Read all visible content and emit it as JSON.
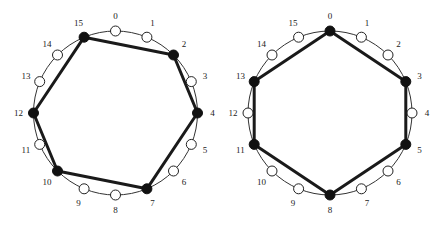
{
  "style": {
    "ring_color": "#333333",
    "edge_color": "#1a1a1a",
    "filled_color": "#111111",
    "open_fill": "#ffffff",
    "open_stroke": "#222222"
  },
  "diagrams": [
    {
      "name": "left-ring",
      "center": [
        115.5,
        113
      ],
      "radius": 82,
      "label_radius": 97,
      "node_count": 16,
      "labels": [
        "0",
        "1",
        "2",
        "3",
        "4",
        "5",
        "6",
        "7",
        "8",
        "9",
        "10",
        "11",
        "12",
        "13",
        "14",
        "15"
      ],
      "filled": [
        15,
        2,
        4,
        7,
        10,
        12
      ],
      "cycle": [
        15,
        2,
        4,
        7,
        10,
        12
      ]
    },
    {
      "name": "right-ring",
      "center": [
        330,
        113
      ],
      "radius": 82,
      "label_radius": 97,
      "node_count": 16,
      "labels": [
        "0",
        "1",
        "2",
        "3",
        "4",
        "5",
        "6",
        "7",
        "8",
        "9",
        "10",
        "11",
        "12",
        "13",
        "14",
        "15"
      ],
      "filled": [
        0,
        3,
        5,
        8,
        11,
        13
      ],
      "cycle": [
        0,
        3,
        5,
        8,
        11,
        13
      ]
    }
  ]
}
